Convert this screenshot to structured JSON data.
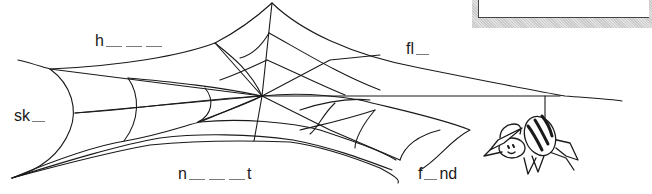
{
  "worksheet": {
    "title": "Spider web word fill-in",
    "words": [
      {
        "id": "h",
        "prefix": "h",
        "blanks": 3,
        "suffix": ""
      },
      {
        "id": "fl",
        "prefix": "fl",
        "blanks": 1,
        "suffix": ""
      },
      {
        "id": "sk",
        "prefix": "sk",
        "blanks": 1,
        "suffix": ""
      },
      {
        "id": "n",
        "prefix": "n",
        "blanks": 3,
        "suffix": "t"
      },
      {
        "id": "f",
        "prefix": "f",
        "blanks": 1,
        "suffix": "nd"
      }
    ],
    "illustration": {
      "web": "spider-web",
      "character": "spider-wearing-hat"
    },
    "answer_box": {
      "visible": true,
      "content": ""
    },
    "colors": {
      "ink": "#1a1a1a",
      "blank_line": "#7a7a7a",
      "box_shadow": "#d0d0d0",
      "background": "#ffffff"
    }
  }
}
